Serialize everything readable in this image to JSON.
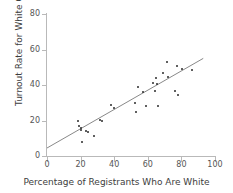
{
  "chart_data": {
    "type": "scatter",
    "title": "",
    "xlabel": "Percentage of Registrants Who Are White",
    "ylabel": "Turnout Rate for White Candidate",
    "xlim": [
      0,
      100
    ],
    "ylim": [
      0,
      80
    ],
    "xticks": [
      0,
      20,
      40,
      60,
      80,
      100
    ],
    "yticks": [
      0,
      20,
      40,
      60,
      80
    ],
    "grid": false,
    "legend": null,
    "marker_color": "#2b2b2b",
    "line_color": "#7a7a7a",
    "axis_color": "#b9b9b9",
    "points": [
      {
        "x": 18.5,
        "y": 19.5
      },
      {
        "x": 19.0,
        "y": 17.0
      },
      {
        "x": 20.0,
        "y": 16.0
      },
      {
        "x": 20.5,
        "y": 14.5
      },
      {
        "x": 21.0,
        "y": 8.0
      },
      {
        "x": 23.5,
        "y": 14.0
      },
      {
        "x": 24.5,
        "y": 13.5
      },
      {
        "x": 28.0,
        "y": 11.0
      },
      {
        "x": 31.5,
        "y": 20.5
      },
      {
        "x": 32.5,
        "y": 19.5
      },
      {
        "x": 38.0,
        "y": 28.5
      },
      {
        "x": 40.0,
        "y": 27.0
      },
      {
        "x": 52.5,
        "y": 30.0
      },
      {
        "x": 53.0,
        "y": 25.0
      },
      {
        "x": 54.0,
        "y": 39.0
      },
      {
        "x": 57.0,
        "y": 36.0
      },
      {
        "x": 59.0,
        "y": 28.0
      },
      {
        "x": 63.0,
        "y": 41.0
      },
      {
        "x": 64.0,
        "y": 36.5
      },
      {
        "x": 65.0,
        "y": 44.0
      },
      {
        "x": 65.5,
        "y": 40.5
      },
      {
        "x": 66.0,
        "y": 28.0
      },
      {
        "x": 69.0,
        "y": 47.0
      },
      {
        "x": 71.5,
        "y": 53.0
      },
      {
        "x": 72.0,
        "y": 44.5
      },
      {
        "x": 76.0,
        "y": 36.5
      },
      {
        "x": 77.5,
        "y": 50.5
      },
      {
        "x": 78.0,
        "y": 34.5
      },
      {
        "x": 80.5,
        "y": 49.0
      },
      {
        "x": 86.5,
        "y": 48.5
      }
    ],
    "trend_line": {
      "x1": 0,
      "y1": 4.5,
      "x2": 93,
      "y2": 55.0
    }
  }
}
